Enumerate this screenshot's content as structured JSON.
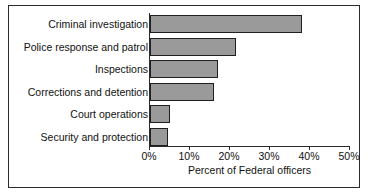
{
  "chart_data": {
    "type": "bar",
    "orientation": "horizontal",
    "title": "",
    "xlabel": "Percent of Federal officers",
    "ylabel": "",
    "categories": [
      "Criminal investigation",
      "Police response and patrol",
      "Inspections",
      "Corrections and detention",
      "Court operations",
      "Security and protection"
    ],
    "values": [
      38,
      21.5,
      17,
      16,
      5,
      4.5
    ],
    "xlim": [
      0,
      50
    ],
    "xticks": [
      0,
      10,
      20,
      30,
      40,
      50
    ],
    "xtick_labels": [
      "0%",
      "10%",
      "20%",
      "30%",
      "40%",
      "50%"
    ],
    "grid": false,
    "legend": null,
    "bar_color": "#9a9a9a",
    "bar_edge_color": "#1f1f1f",
    "axis_color": "#2b2b2b",
    "frame_color": "#2b2b2b",
    "background": "#ffffff"
  }
}
